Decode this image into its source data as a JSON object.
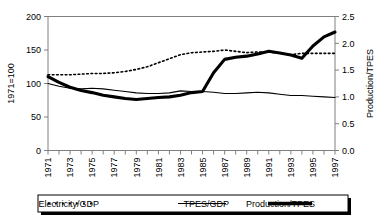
{
  "chart_data": {
    "type": "line",
    "title": "",
    "xlabel": "",
    "ylabel": "1971=100",
    "y2label": "Production/TPES",
    "xlim": [
      1971,
      1997
    ],
    "ylim": [
      0,
      200
    ],
    "y2lim": [
      0.0,
      2.5
    ],
    "grid": false,
    "legend_position": "bottom",
    "x": [
      1971,
      1972,
      1973,
      1974,
      1975,
      1976,
      1977,
      1978,
      1979,
      1980,
      1981,
      1982,
      1983,
      1984,
      1985,
      1986,
      1987,
      1988,
      1989,
      1990,
      1991,
      1992,
      1993,
      1994,
      1995,
      1996,
      1997
    ],
    "categories": [
      "1971",
      "1972",
      "1973",
      "1974",
      "1975",
      "1976",
      "1977",
      "1978",
      "1979",
      "1980",
      "1981",
      "1982",
      "1983",
      "1984",
      "1985",
      "1986",
      "1987",
      "1988",
      "1989",
      "1990",
      "1991",
      "1992",
      "1993",
      "1994",
      "1995",
      "1996",
      "1997"
    ],
    "ytick_labels": [
      "0",
      "50",
      "100",
      "150",
      "200"
    ],
    "ytick_values": [
      0,
      50,
      100,
      150,
      200
    ],
    "y2tick_labels": [
      "0.0",
      "0.5",
      "1.0",
      "1.5",
      "2.0",
      "2.5"
    ],
    "y2tick_values": [
      0.0,
      0.5,
      1.0,
      1.5,
      2.0,
      2.5
    ],
    "xtick_labels": [
      "1971",
      "1973",
      "1975",
      "1977",
      "1979",
      "1981",
      "1983",
      "1985",
      "1987",
      "1989",
      "1991",
      "1993",
      "1995",
      "1997"
    ],
    "series": [
      {
        "name": "Electricity/GDP",
        "axis": "left",
        "style": "dotted",
        "values": [
          113,
          113,
          113,
          114,
          115,
          115,
          116,
          118,
          121,
          125,
          131,
          137,
          143,
          146,
          147,
          148,
          150,
          148,
          146,
          147,
          147,
          145,
          143,
          145,
          145,
          145,
          145
        ]
      },
      {
        "name": "TPES/GDP",
        "axis": "left",
        "style": "thin-solid",
        "values": [
          100,
          96,
          93,
          92,
          93,
          92,
          90,
          88,
          86,
          85,
          85,
          86,
          89,
          88,
          88,
          87,
          85,
          85,
          86,
          87,
          86,
          84,
          82,
          82,
          81,
          80,
          79
        ]
      },
      {
        "name": "Production/TPES",
        "axis": "right",
        "style": "thick-solid",
        "values": [
          1.38,
          1.27,
          1.18,
          1.12,
          1.08,
          1.03,
          1.0,
          0.97,
          0.95,
          0.97,
          0.99,
          1.0,
          1.03,
          1.08,
          1.1,
          1.45,
          1.7,
          1.74,
          1.76,
          1.8,
          1.85,
          1.82,
          1.78,
          1.72,
          1.95,
          2.12,
          2.21
        ]
      }
    ]
  },
  "legend": {
    "items": [
      {
        "label": "Electricity/GDP",
        "style": "dotted"
      },
      {
        "label": "TPES/GDP",
        "style": "thin-solid"
      },
      {
        "label": "Production/TPES",
        "style": "thick-solid"
      }
    ]
  },
  "axes": {
    "left_title": "1971=100",
    "right_title": "Production/TPES"
  }
}
